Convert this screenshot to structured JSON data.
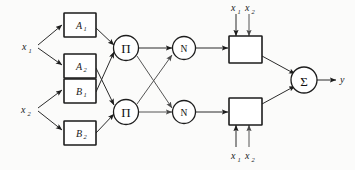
{
  "figure": {
    "background_color": "#fbfbfa",
    "line_color": "#2b2b2b",
    "node_fill": "#ffffff",
    "node_stroke": "#1d1d1d"
  },
  "inputs": [
    {
      "id": "x1",
      "base": "x",
      "sub": "1"
    },
    {
      "id": "x2",
      "base": "x",
      "sub": "2"
    }
  ],
  "membership_nodes": [
    {
      "id": "A1",
      "base": "A",
      "sub": "1"
    },
    {
      "id": "A2",
      "base": "A",
      "sub": "2"
    },
    {
      "id": "B1",
      "base": "B",
      "sub": "1"
    },
    {
      "id": "B2",
      "base": "B",
      "sub": "2"
    }
  ],
  "product_nodes": [
    {
      "id": "prod-top",
      "symbol": "Π"
    },
    {
      "id": "prod-bottom",
      "symbol": "Π"
    }
  ],
  "normalization_nodes": [
    {
      "id": "norm-top",
      "symbol": "N"
    },
    {
      "id": "norm-bottom",
      "symbol": "N"
    }
  ],
  "consequent_nodes": [
    {
      "id": "conseq-top",
      "label": ""
    },
    {
      "id": "conseq-bottom",
      "label": ""
    }
  ],
  "consequent_inputs": {
    "top": [
      {
        "base": "x",
        "sub": "1"
      },
      {
        "base": "x",
        "sub": "2"
      }
    ],
    "bottom": [
      {
        "base": "x",
        "sub": "1"
      },
      {
        "base": "x",
        "sub": "2"
      }
    ]
  },
  "summation_node": {
    "id": "sum",
    "symbol": "Σ"
  },
  "output": {
    "id": "y",
    "base": "y",
    "sub": ""
  }
}
